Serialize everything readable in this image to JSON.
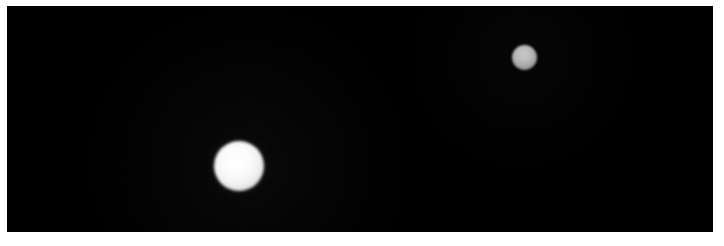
{
  "image": {
    "kind": "astronomical-photograph",
    "caption": "",
    "width_px": 724,
    "height_px": 246,
    "border_color": "#ffffff",
    "background_color": "#000000"
  },
  "frame": {
    "border_left_px": 7,
    "border_top_px": 6,
    "border_right_px": 11,
    "border_bottom_px": 14,
    "field_width_px": 706,
    "field_height_px": 226
  },
  "objects": [
    {
      "id": "body-large",
      "label": "",
      "role": "primary-bright-disc",
      "center_x_px": 239,
      "center_y_px": 166,
      "diameter_px": 50,
      "core_color": "#f4f4f4",
      "edge_color": "#9a9a9a",
      "relative_brightness": 1.0
    },
    {
      "id": "body-small",
      "label": "",
      "role": "secondary-dim-disc",
      "center_x_px": 524,
      "center_y_px": 57,
      "diameter_px": 25,
      "core_color": "#b4b4b4",
      "edge_color": "#6a6a6a",
      "relative_brightness": 0.68
    }
  ],
  "annotations": [],
  "labels": []
}
